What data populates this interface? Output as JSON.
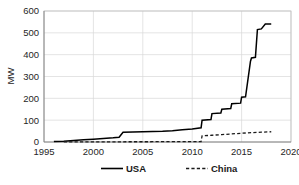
{
  "chart_data": {
    "type": "line",
    "title": "",
    "xlabel": "",
    "ylabel": "MW",
    "xlim": [
      1995,
      2020
    ],
    "ylim": [
      0,
      600
    ],
    "xticks": [
      1995,
      2000,
      2005,
      2010,
      2015,
      2020
    ],
    "yticks": [
      0,
      100,
      200,
      300,
      400,
      500,
      600
    ],
    "xtick_labels": [
      "1995",
      "2000",
      "2005",
      "2010",
      "2015",
      "2020"
    ],
    "ytick_labels": [
      "0",
      "100",
      "200",
      "300",
      "400",
      "500",
      "600"
    ],
    "grid": true,
    "legend_position": "bottom",
    "series": [
      {
        "name": "USA",
        "style": "solid",
        "color": "#000000",
        "x": [
          1996,
          1997,
          1998,
          1999,
          2000,
          2001,
          2002,
          2002.6,
          2003,
          2004,
          2005,
          2006,
          2007,
          2008,
          2009,
          2010,
          2010.9,
          2011,
          2011.9,
          2012,
          2012.9,
          2013,
          2013.9,
          2014,
          2014.9,
          2015,
          2015.4,
          2015.9,
          2016,
          2016.4,
          2016.6,
          2017,
          2017.4,
          2018
        ],
        "y": [
          2,
          4,
          7,
          10,
          13,
          16,
          19,
          22,
          45,
          46,
          47,
          48,
          49,
          52,
          56,
          60,
          65,
          100,
          103,
          130,
          133,
          150,
          153,
          175,
          178,
          205,
          207,
          370,
          385,
          388,
          515,
          518,
          540,
          541
        ]
      },
      {
        "name": "China",
        "style": "dashed",
        "color": "#1a1a1a",
        "x": [
          1997,
          2000,
          2003,
          2006,
          2008,
          2010,
          2010.9,
          2011,
          2012,
          2013,
          2014,
          2015,
          2016,
          2017,
          2018
        ],
        "y": [
          0.5,
          0.8,
          1.0,
          1.3,
          1.6,
          1.9,
          2.2,
          28,
          31,
          34,
          37,
          40,
          43,
          45,
          47
        ]
      }
    ],
    "legend": [
      {
        "label": "USA",
        "style": "solid",
        "color": "#000000"
      },
      {
        "label": "China",
        "style": "dashed",
        "color": "#1a1a1a"
      }
    ]
  }
}
